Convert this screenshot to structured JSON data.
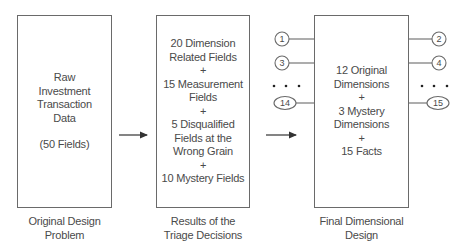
{
  "diagram": {
    "stages": [
      {
        "id": "original",
        "box_lines": [
          "Raw",
          "Investment",
          "Transaction",
          "Data",
          "",
          "(50 Fields)"
        ],
        "caption": [
          "Original Design",
          "Problem"
        ]
      },
      {
        "id": "triage",
        "box_lines": [
          "20 Dimension",
          "Related Fields",
          "+",
          "15 Measurement",
          "Fields",
          "+",
          "5 Disqualified",
          "Fields at the",
          "Wrong Grain",
          "+",
          "10 Mystery Fields"
        ],
        "caption": [
          "Results of the",
          "Triage Decisions"
        ]
      },
      {
        "id": "final",
        "box_lines": [
          "12 Original",
          "Dimensions",
          "+",
          "3 Mystery",
          "Dimensions",
          "+",
          "15 Facts"
        ],
        "caption": [
          "Final Dimensional",
          "Design"
        ]
      }
    ],
    "left_dimension_nodes": [
      "1",
      "3",
      "14"
    ],
    "right_dimension_nodes": [
      "2",
      "4",
      "15"
    ],
    "ellipsis": "• • •",
    "colors": {
      "stroke": "#6a6a6a",
      "text": "#4a4a4a",
      "arrow": "#333333"
    }
  }
}
